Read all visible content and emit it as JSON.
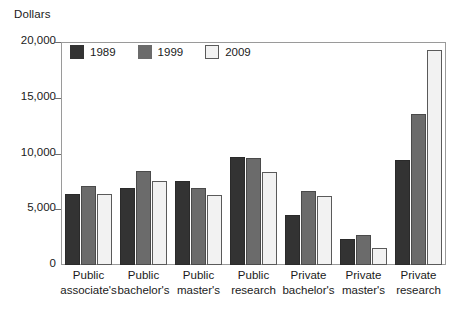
{
  "chart_data": {
    "type": "bar",
    "title": "",
    "ylabel": "Dollars",
    "xlabel": "",
    "ylim": [
      0,
      20000
    ],
    "yticks": [
      0,
      5000,
      10000,
      15000,
      20000
    ],
    "ytick_labels": [
      "0",
      "5,000",
      "10,000",
      "15,000",
      "20,000"
    ],
    "grid": false,
    "legend_position": "top-left inside plot",
    "categories": [
      "Public associate's",
      "Public bachelor's",
      "Public master's",
      "Public research",
      "Private bachelor's",
      "Private master's",
      "Private research"
    ],
    "category_lines": [
      [
        "Public",
        "associate's"
      ],
      [
        "Public",
        "bachelor's"
      ],
      [
        "Public",
        "master's"
      ],
      [
        "Public",
        "research"
      ],
      [
        "Private",
        "bachelor's"
      ],
      [
        "Private",
        "master's"
      ],
      [
        "Private",
        "research"
      ]
    ],
    "series": [
      {
        "name": "1989",
        "color": "#333333",
        "values": [
          6400,
          6900,
          7500,
          9700,
          4500,
          2300,
          9400
        ]
      },
      {
        "name": "1999",
        "color": "#6b6b6b",
        "values": [
          7100,
          8400,
          6900,
          9600,
          6600,
          2700,
          13500
        ]
      },
      {
        "name": "2009",
        "color": "#f2f2f2",
        "values": [
          6400,
          7500,
          6300,
          8300,
          6200,
          1500,
          19300
        ]
      }
    ]
  },
  "colors": {
    "series_1989": "#333333",
    "series_1999": "#6b6b6b",
    "series_2009": "#f2f2f2",
    "frame": "#9a9a9a",
    "text": "#1a1a1a",
    "background": "#ffffff"
  }
}
